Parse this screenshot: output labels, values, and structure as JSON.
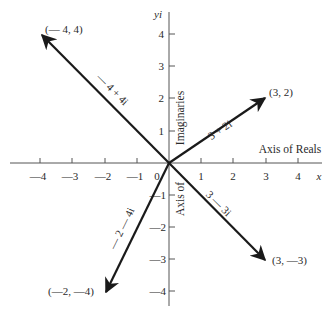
{
  "diagram": {
    "type": "complex-plane-vectors",
    "origin_px": [
      169,
      163
    ],
    "unit_px": 32.2,
    "colors": {
      "ink": "#1a1a1a",
      "axis": "#555555",
      "text": "#2a2a2a",
      "background": "#ffffff"
    },
    "axes": {
      "x_label": "x",
      "y_label": "yi",
      "x_axis_name": "Axis of Reals",
      "y_axis_name_upper": "Imaginaries",
      "y_axis_name_lower": "Axis of",
      "origin_label": "0",
      "x_ticks": [
        "—4",
        "—3",
        "—2",
        "—1",
        "1",
        "2",
        "3",
        "4"
      ],
      "x_tick_values": [
        -4,
        -3,
        -2,
        -1,
        1,
        2,
        3,
        4
      ],
      "y_ticks": [
        "4",
        "3",
        "2",
        "1",
        "—1",
        "—2",
        "—3",
        "—4"
      ],
      "y_tick_values": [
        4,
        3,
        2,
        1,
        -1,
        -2,
        -3,
        -4
      ]
    },
    "vectors": [
      {
        "point": [
          -4,
          4
        ],
        "point_label": "(— 4, 4)",
        "expr": "— 4 + 4i"
      },
      {
        "point": [
          3,
          2
        ],
        "point_label": "(3, 2)",
        "expr": "3 + 2i"
      },
      {
        "point": [
          3,
          -3
        ],
        "point_label": "(3, —3)",
        "expr": "3 — 3i"
      },
      {
        "point": [
          -2,
          -4
        ],
        "point_label": "(—2, —4)",
        "expr": "— 2 — 4i"
      }
    ]
  }
}
